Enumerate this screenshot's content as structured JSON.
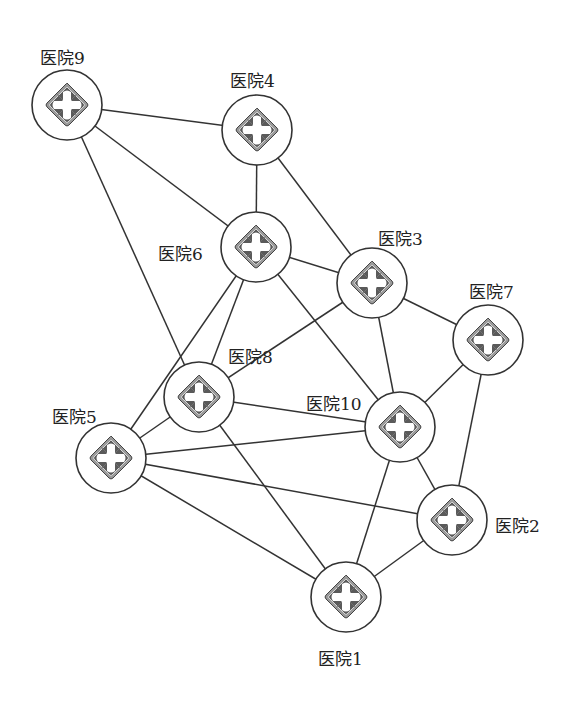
{
  "diagram": {
    "title": "",
    "node_radius": 35,
    "colors": {
      "line": "#333333",
      "icon_dark": "#555555",
      "icon_mid": "#8a8a8a",
      "bg": "#ffffff"
    },
    "nodes": [
      {
        "id": "1",
        "label": "医院1",
        "x": 346,
        "y": 597,
        "label_x": 318,
        "label_y": 645
      },
      {
        "id": "2",
        "label": "医院2",
        "x": 452,
        "y": 520,
        "label_x": 495,
        "label_y": 512
      },
      {
        "id": "3",
        "label": "医院3",
        "x": 372,
        "y": 283,
        "label_x": 378,
        "label_y": 225
      },
      {
        "id": "4",
        "label": "医院4",
        "x": 257,
        "y": 130,
        "label_x": 230,
        "label_y": 67
      },
      {
        "id": "5",
        "label": "医院5",
        "x": 111,
        "y": 458,
        "label_x": 52,
        "label_y": 403
      },
      {
        "id": "6",
        "label": "医院6",
        "x": 256,
        "y": 247,
        "label_x": 158,
        "label_y": 240
      },
      {
        "id": "7",
        "label": "医院7",
        "x": 488,
        "y": 340,
        "label_x": 469,
        "label_y": 278
      },
      {
        "id": "8",
        "label": "医院8",
        "x": 199,
        "y": 397,
        "label_x": 228,
        "label_y": 343
      },
      {
        "id": "9",
        "label": "医院9",
        "x": 67,
        "y": 105,
        "label_x": 40,
        "label_y": 44
      },
      {
        "id": "10",
        "label": "医院10",
        "x": 400,
        "y": 427,
        "label_x": 306,
        "label_y": 390
      }
    ],
    "edges": [
      [
        "9",
        "4"
      ],
      [
        "9",
        "6"
      ],
      [
        "9",
        "8"
      ],
      [
        "4",
        "6"
      ],
      [
        "4",
        "3"
      ],
      [
        "6",
        "3"
      ],
      [
        "6",
        "8"
      ],
      [
        "6",
        "5"
      ],
      [
        "6",
        "10"
      ],
      [
        "3",
        "8"
      ],
      [
        "3",
        "10"
      ],
      [
        "3",
        "7"
      ],
      [
        "7",
        "10"
      ],
      [
        "7",
        "2"
      ],
      [
        "8",
        "10"
      ],
      [
        "8",
        "5"
      ],
      [
        "8",
        "1"
      ],
      [
        "5",
        "10"
      ],
      [
        "5",
        "2"
      ],
      [
        "5",
        "1"
      ],
      [
        "10",
        "2"
      ],
      [
        "10",
        "1"
      ],
      [
        "2",
        "1"
      ]
    ]
  }
}
